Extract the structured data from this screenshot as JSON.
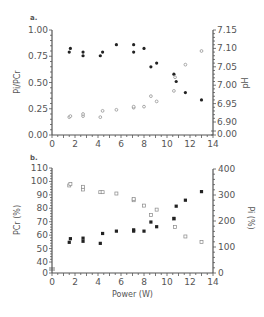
{
  "chart_data": [
    {
      "panel": "a.",
      "type": "scatter",
      "xlabel": "",
      "ylabel": "Pi/PCr",
      "y2label": "pH",
      "xlim": [
        0,
        14
      ],
      "ylim": [
        0,
        1.0
      ],
      "y2lim": [
        6.9,
        7.15
      ],
      "x_ticks": [
        "0",
        "2",
        "4",
        "6",
        "8",
        "10",
        "12",
        "14"
      ],
      "y_ticks": [
        "0.00",
        "0.25",
        "0.50",
        "0.75",
        "1.00"
      ],
      "y2_ticks": [
        "0.00",
        "6.90",
        "6.95",
        "7.00",
        "7.05",
        "7.10",
        "7.15"
      ],
      "series": [
        {
          "name": "pH (filled)",
          "axis": "right",
          "marker": "filled-circle",
          "x": [
            1.5,
            1.6,
            2.7,
            2.7,
            4.2,
            4.4,
            5.6,
            7.1,
            7.1,
            8.0,
            8.6,
            9.1,
            10.6,
            10.8,
            11.6,
            13.0
          ],
          "y": [
            7.09,
            7.1,
            7.09,
            7.08,
            7.08,
            7.09,
            7.11,
            7.11,
            7.09,
            7.1,
            7.05,
            7.06,
            7.03,
            7.01,
            6.98,
            6.96
          ]
        },
        {
          "name": "Pi/PCr (open)",
          "axis": "left",
          "marker": "open-circle",
          "x": [
            1.5,
            1.6,
            2.7,
            2.7,
            4.2,
            4.4,
            5.6,
            7.1,
            7.1,
            8.0,
            8.6,
            9.1,
            10.6,
            10.7,
            11.6,
            13.0
          ],
          "y": [
            0.17,
            0.18,
            0.18,
            0.2,
            0.17,
            0.23,
            0.24,
            0.26,
            0.27,
            0.27,
            0.37,
            0.32,
            0.42,
            0.55,
            0.67,
            0.8
          ]
        }
      ]
    },
    {
      "panel": "b.",
      "type": "scatter",
      "xlabel": "Power (W)",
      "ylabel": "PCr (%)",
      "y2label": "Pi (%)",
      "xlim": [
        0,
        14
      ],
      "ylim": [
        0,
        110
      ],
      "y2lim": [
        0,
        400
      ],
      "x_ticks": [
        "0",
        "2",
        "4",
        "6",
        "8",
        "10",
        "12",
        "14"
      ],
      "y_ticks": [
        "0",
        "40",
        "50",
        "60",
        "70",
        "80",
        "90",
        "100",
        "110"
      ],
      "y2_ticks": [
        "0",
        "100",
        "200",
        "300",
        "400"
      ],
      "series": [
        {
          "name": "PCr (open)",
          "axis": "left",
          "marker": "open-square",
          "x": [
            1.5,
            1.6,
            2.7,
            2.7,
            4.2,
            4.4,
            5.6,
            7.1,
            7.1,
            8.0,
            8.6,
            9.1,
            10.6,
            10.7,
            11.6,
            13.0
          ],
          "y": [
            97,
            98,
            94,
            96,
            92,
            92,
            91,
            86,
            87,
            82,
            75,
            79,
            72,
            66,
            59,
            55
          ]
        },
        {
          "name": "Pi (filled)",
          "axis": "right",
          "marker": "filled-square",
          "x": [
            1.5,
            1.6,
            2.7,
            2.7,
            4.2,
            4.4,
            5.6,
            7.1,
            7.1,
            8.0,
            8.6,
            9.1,
            10.6,
            10.8,
            11.6,
            13.0
          ],
          "y": [
            118,
            132,
            122,
            134,
            114,
            152,
            161,
            161,
            166,
            161,
            196,
            178,
            210,
            257,
            280,
            313
          ]
        }
      ]
    }
  ],
  "labels": {
    "panel_a": "a.",
    "panel_b": "b.",
    "a_ylabel": "Pi/PCr",
    "a_y2label": "pH",
    "b_ylabel": "PCr (%)",
    "b_y2label": "Pi (%)",
    "b_xlabel": "Power (W)"
  },
  "colors": {
    "axis": "#555555",
    "filled_marker": "#222222",
    "open_marker": "#888888"
  }
}
